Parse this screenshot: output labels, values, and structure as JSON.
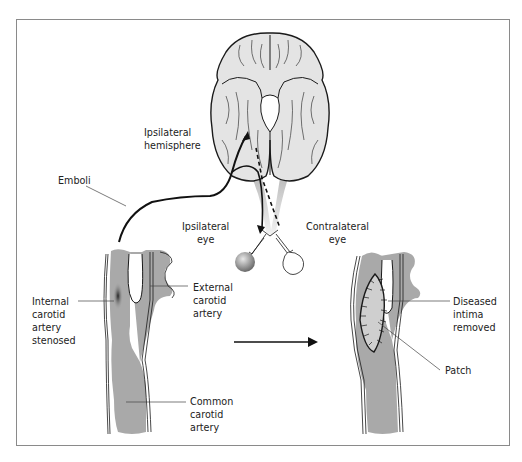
{
  "figure": {
    "labels": {
      "ipsilateral_hemisphere": "Ipsilateral\nhemisphere",
      "emboli": "Emboli",
      "ipsilateral_eye": "Ipsilateral\neye",
      "contralateral_eye": "Contralateral\neye",
      "internal_carotid": "Internal\ncarotid\nartery\nstenosed",
      "external_carotid": "External\ncarotid\nartery",
      "common_carotid": "Common\ncarotid\nartery",
      "diseased_intima": "Diseased\nintima\nremoved",
      "patch": "Patch"
    },
    "colors": {
      "vessel_fill": "#a9a9a9",
      "brain_fill": "#e4e4e4",
      "outline": "#1a1a1a",
      "frame": "#8a8a8a",
      "patch_fill": "#cfcfcf"
    }
  }
}
